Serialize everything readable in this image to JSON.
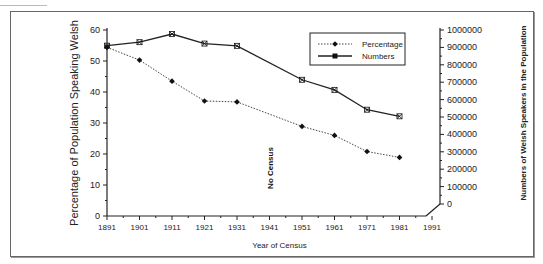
{
  "chart_data": {
    "type": "line",
    "title": "",
    "xlabel": "Year of Census",
    "ylabel": "Percentage of Population Speaking Welsh",
    "y2label": "Numbers of Welsh Speakers in the Population",
    "x": [
      1891,
      1901,
      1911,
      1921,
      1931,
      1951,
      1961,
      1971,
      1981
    ],
    "x_ticks": [
      "1891",
      "1901",
      "1911",
      "1921",
      "1931",
      "1941",
      "1951",
      "1961",
      "1971",
      "1981",
      "1991"
    ],
    "y_ticks": [
      "0",
      "10",
      "20",
      "30",
      "40",
      "50",
      "60"
    ],
    "y2_ticks": [
      "0",
      "100000",
      "200000",
      "300000",
      "400000",
      "500000",
      "600000",
      "700000",
      "800000",
      "900000",
      "1000000"
    ],
    "ylim": [
      0,
      60
    ],
    "y2lim": [
      0,
      1000000
    ],
    "xlim": [
      1891,
      1991
    ],
    "series": [
      {
        "name": "Percentage",
        "axis": "left",
        "style": "dotted",
        "marker": "diamond",
        "values": [
          54.4,
          50.3,
          43.5,
          37.1,
          36.8,
          28.9,
          26.0,
          20.8,
          18.9
        ]
      },
      {
        "name": "Numbers",
        "axis": "right",
        "style": "solid",
        "marker": "x-square",
        "values": [
          910000,
          930000,
          977000,
          922000,
          909000,
          714000,
          656000,
          542000,
          504000
        ]
      }
    ],
    "annotations": [
      {
        "text": "No Census",
        "x": 1941
      }
    ],
    "legend": {
      "position": "top-right",
      "entries": [
        "Percentage",
        "Numbers"
      ]
    },
    "grid": false
  }
}
